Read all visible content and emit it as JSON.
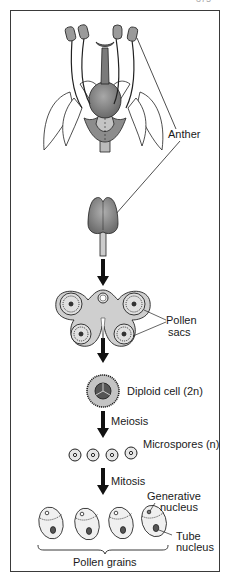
{
  "page_number": "375",
  "labels": {
    "anther": "Anther",
    "pollen_sacs_1": "Pollen",
    "pollen_sacs_2": "sacs",
    "diploid_cell": "Diploid cell (2n)",
    "meiosis": "Meiosis",
    "microspores": "Microspores (n)",
    "mitosis": "Mitosis",
    "generative_1": "Generative",
    "generative_2": "nucleus",
    "tube_1": "Tube",
    "tube_2": "nucleus",
    "pollen_grains": "Pollen grains"
  },
  "stages": [
    {
      "name": "flower",
      "description": "Flower with four stamens and central pistil"
    },
    {
      "name": "stamen",
      "description": "Isolated stamen with anther"
    },
    {
      "name": "anther-cross-section",
      "description": "Cross-section of anther showing four pollen sacs"
    },
    {
      "name": "diploid-cell",
      "description": "Microspore mother cell"
    },
    {
      "name": "microspores",
      "count": 4
    },
    {
      "name": "pollen-grains",
      "count": 4
    }
  ],
  "colors": {
    "ink": "#1a1a1a",
    "fill_gray": "#9a9a9a",
    "fill_light": "#c8c8c8",
    "frame": "#3a3a3a"
  }
}
